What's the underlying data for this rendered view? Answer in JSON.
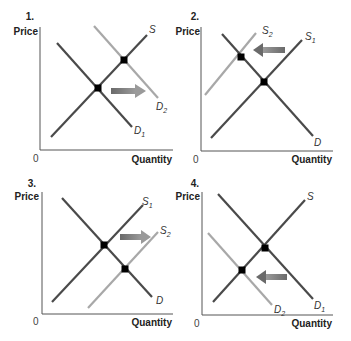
{
  "colors": {
    "dark_line": "#4a4a4a",
    "light_line": "#a8a8a8",
    "arrow": "#7a7a7a",
    "axis": "#555555",
    "point": "#000000"
  },
  "axes": {
    "y_label": "Price",
    "x_label": "Quantity",
    "origin": "0"
  },
  "panels": [
    {
      "number": "1.",
      "curves": {
        "s": "S",
        "d1": "D",
        "d1_sub": "1",
        "d2": "D",
        "d2_sub": "2"
      },
      "shift": "Demand increases (D1 → D2, rightward)"
    },
    {
      "number": "2.",
      "curves": {
        "s2": "S",
        "s2_sub": "2",
        "s1": "S",
        "s1_sub": "1",
        "d": "D"
      },
      "shift": "Supply decreases (S1 → S2, leftward)"
    },
    {
      "number": "3.",
      "curves": {
        "s1": "S",
        "s1_sub": "1",
        "s2": "S",
        "s2_sub": "2",
        "d": "D"
      },
      "shift": "Supply increases (S1 → S2, rightward)"
    },
    {
      "number": "4.",
      "curves": {
        "s": "S",
        "d2": "D",
        "d2_sub": "2",
        "d1": "D",
        "d1_sub": "1"
      },
      "shift": "Demand decreases (D1 → D2, leftward)"
    }
  ]
}
